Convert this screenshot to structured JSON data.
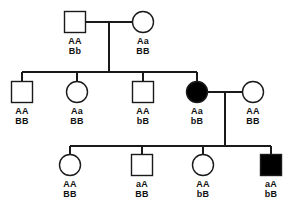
{
  "diagram": {
    "type": "pedigree",
    "symbols": {
      "square": "male",
      "circle": "female",
      "filled": "affected",
      "open": "unaffected"
    },
    "colors": {
      "line": "#1a1a1a",
      "fill_affected": "#000000",
      "fill_unaffected": "#ffffff",
      "text": "#111111",
      "background": "#ffffff"
    },
    "generations": [
      {
        "id": "I",
        "individuals": [
          {
            "id": "I-1",
            "shape": "square",
            "sex": "male",
            "affected": false,
            "gene1": "AA",
            "gene2": "Bb",
            "cx": 75,
            "cy": 22
          },
          {
            "id": "I-2",
            "shape": "circle",
            "sex": "female",
            "affected": false,
            "gene1": "Aa",
            "gene2": "BB",
            "cx": 143,
            "cy": 22
          }
        ]
      },
      {
        "id": "II",
        "individuals": [
          {
            "id": "II-1",
            "shape": "square",
            "sex": "male",
            "affected": false,
            "gene1": "AA",
            "gene2": "BB",
            "cx": 22,
            "cy": 92
          },
          {
            "id": "II-2",
            "shape": "circle",
            "sex": "female",
            "affected": false,
            "gene1": "Aa",
            "gene2": "BB",
            "cx": 77,
            "cy": 92
          },
          {
            "id": "II-3",
            "shape": "square",
            "sex": "male",
            "affected": false,
            "gene1": "AA",
            "gene2": "bB",
            "cx": 143,
            "cy": 92
          },
          {
            "id": "II-4",
            "shape": "circle",
            "sex": "female",
            "affected": true,
            "gene1": "Aa",
            "gene2": "bB",
            "cx": 197,
            "cy": 92
          },
          {
            "id": "II-5",
            "shape": "circle",
            "sex": "female",
            "affected": false,
            "gene1": "AA",
            "gene2": "BB",
            "cx": 253,
            "cy": 92
          }
        ]
      },
      {
        "id": "III",
        "individuals": [
          {
            "id": "III-1",
            "shape": "circle",
            "sex": "female",
            "affected": false,
            "gene1": "AA",
            "gene2": "BB",
            "cx": 70,
            "cy": 165
          },
          {
            "id": "III-2",
            "shape": "square",
            "sex": "male",
            "affected": false,
            "gene1": "aA",
            "gene2": "BB",
            "cx": 142,
            "cy": 165
          },
          {
            "id": "III-3",
            "shape": "circle",
            "sex": "female",
            "affected": false,
            "gene1": "AA",
            "gene2": "bB",
            "cx": 203,
            "cy": 165
          },
          {
            "id": "III-4",
            "shape": "square",
            "sex": "male",
            "affected": true,
            "gene1": "aA",
            "gene2": "bB",
            "cx": 271,
            "cy": 165
          }
        ]
      }
    ],
    "matings": [
      {
        "id": "mating-I",
        "partners": [
          "I-1",
          "I-2"
        ],
        "line_y": 22,
        "x1": 86,
        "x2": 133,
        "descent_x": 109,
        "descent_y2": 72
      },
      {
        "id": "mating-II",
        "partners": [
          "II-4",
          "II-5"
        ],
        "line_y": 92,
        "x1": 208,
        "x2": 243,
        "descent_x": 225,
        "descent_y2": 146
      }
    ],
    "sibships": [
      {
        "id": "sibship-II",
        "line_y": 72,
        "x1": 22,
        "x2": 197,
        "children": [
          "II-1",
          "II-2",
          "II-3",
          "II-4"
        ]
      },
      {
        "id": "sibship-III",
        "line_y": 146,
        "x1": 70,
        "x2": 271,
        "children": [
          "III-1",
          "III-2",
          "III-3",
          "III-4"
        ]
      }
    ]
  }
}
